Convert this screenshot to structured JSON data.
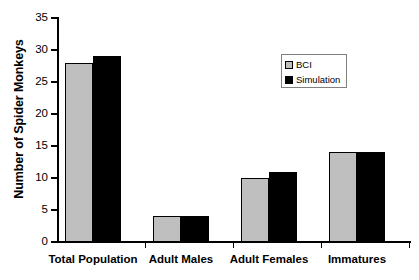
{
  "chart_data": {
    "type": "bar",
    "title": "",
    "subtitle": "",
    "xlabel": "",
    "ylabel": "Number of Spider Monkeys",
    "categories": [
      "Total Population",
      "Adult Males",
      "Adult Females",
      "Immatures"
    ],
    "series": [
      {
        "name": "BCI",
        "values": [
          28,
          4,
          10,
          14
        ],
        "color": "#bfbfbf"
      },
      {
        "name": "Simulation",
        "values": [
          29,
          4,
          11,
          14
        ],
        "color": "#000000"
      }
    ],
    "ylim": [
      0,
      35
    ],
    "ytick_values": [
      0,
      5,
      10,
      15,
      20,
      25,
      30,
      35
    ],
    "ytick_labels": [
      "0",
      "5",
      "10",
      "15",
      "20",
      "25",
      "30",
      "35"
    ],
    "grid": false,
    "legend_position": "upper-right",
    "legend_entries": [
      "BCI",
      "Simulation"
    ]
  },
  "axes": {
    "y_title": "Number of Spider Monkeys"
  }
}
